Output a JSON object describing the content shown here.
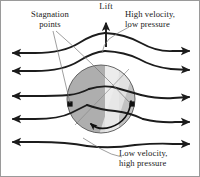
{
  "figure": {
    "background_color": "#ffffff",
    "border_color": "#9a9a9a"
  },
  "labels": {
    "stagnation": {
      "line1": "Stagnation",
      "line2": "points"
    },
    "lift": {
      "line1": "Lift"
    },
    "high_velocity": {
      "line1": "High velocity,",
      "line2": "low pressure"
    },
    "low_velocity": {
      "line1": "Low velocity,",
      "line2": "high pressure"
    }
  },
  "colors": {
    "streamline": "#1c1c1c",
    "leader": "#6b6b6b",
    "sphere_outline": "#4a4a4a",
    "sphere_dark": "#a9a9a9",
    "sphere_mid": "#b8b8b8",
    "sphere_light": "#e3e3e3",
    "stagnation_dot": "#111111",
    "text": "#1a1a1a"
  },
  "geometry": {
    "sphere_center_x": 100,
    "sphere_center_y": 98,
    "sphere_radius": 34,
    "stagnation_points": [
      {
        "x": 69,
        "y": 103
      },
      {
        "x": 131,
        "y": 103
      }
    ],
    "lift_arrow": {
      "x": 105,
      "y_top": 20,
      "y_bottom": 46
    },
    "rotation": "counterclockwise",
    "streamline_count_left": 5,
    "streamline_count_right": 5
  }
}
